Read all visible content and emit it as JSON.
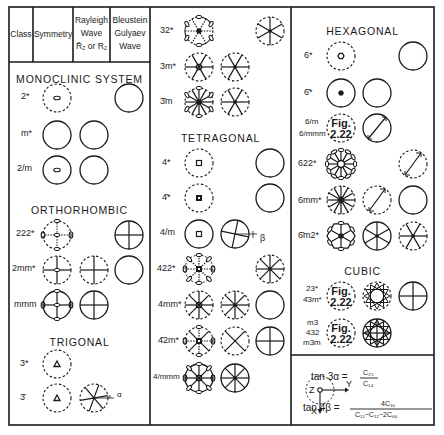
{
  "header": {
    "class": "Class",
    "symmetry": "Symmetry",
    "rayleigh": [
      "Rayleigh",
      "Wave",
      "R̄₂ or R₂"
    ],
    "bg": [
      "Bleustein",
      "Gulyaev",
      "Wave"
    ]
  },
  "sections": {
    "monoclinic": "MONOCLINIC SYSTEM",
    "orthorhombic": "ORTHORHOMBIC",
    "trigonal": "TRIGONAL",
    "tetragonal": "TETRAGONAL",
    "hexagonal": "HEXAGONAL",
    "cubic": "CUBIC"
  },
  "classes": {
    "c2": "2*",
    "cm": "m*",
    "c2m": "2/m",
    "c222": "222*",
    "c2mm": "2mm*",
    "cmmm": "mmm",
    "c3": "3*",
    "c3bar": "3̄",
    "c32": "32*",
    "c3m": "3m*",
    "c3barm": "3̄m",
    "c4": "4*",
    "c4bar": "4̄*",
    "c4m": "4/m",
    "c422": "422*",
    "c4mm": "4mm*",
    "c4bar2m": "4̄2m*",
    "c4mmm": "4/mmm",
    "c6": "6*",
    "c6bar": "6̄*",
    "c6m": "6/m",
    "c6mmm": "6/mmm",
    "c622": "622*",
    "c6mm": "6mm*",
    "c6barm2": "6̄m2*",
    "c23": "23*",
    "c4bar3m": "4̄3m*",
    "cm3": "m3",
    "c432": "432",
    "cm3m": "m3m"
  },
  "fig_ref": [
    "Fig.",
    "2.22"
  ],
  "angles": {
    "alpha": "α",
    "beta": "β"
  },
  "axes": {
    "z": "Z",
    "y": "Y",
    "x": "X"
  },
  "formula": {
    "eq1_lhs": "tan 3α =",
    "eq1_num": "C₂₅",
    "eq1_den": "C₁₄",
    "eq2_lhs": "tan 4β =",
    "eq2_num": "4C₁₆",
    "eq2_den": "C₁₁−C₁₂−2C₆₆"
  }
}
